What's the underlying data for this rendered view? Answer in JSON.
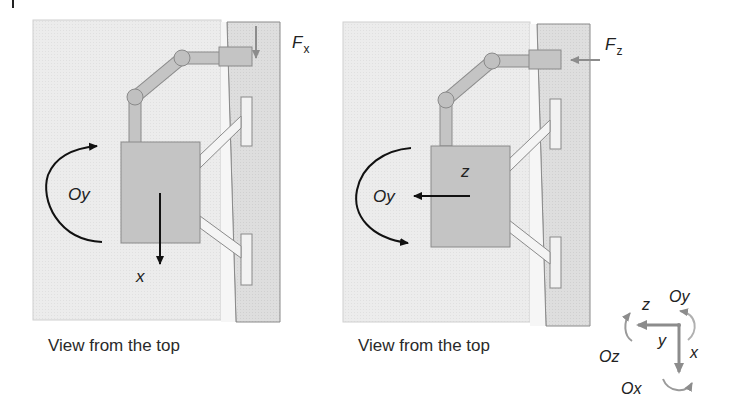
{
  "figure": {
    "panels": [
      {
        "id": "left",
        "caption": "View from the top",
        "force_label": "F",
        "force_subscript": "x",
        "rotation_label": "Oy",
        "axis_label": "x",
        "force_direction": "down",
        "rotation_direction": "counter-clockwise-top-arrow"
      },
      {
        "id": "right",
        "caption": "View from the top",
        "force_label": "F",
        "force_subscript": "z",
        "rotation_label": "Oy",
        "axis_label": "z",
        "force_direction": "left",
        "rotation_direction": "bottom-arrow"
      }
    ],
    "coordinate_frame": {
      "axes": [
        "z",
        "y",
        "x"
      ],
      "rotations": [
        "Oy",
        "Oz",
        "Ox"
      ],
      "z_label": "z",
      "y_label": "y",
      "x_label": "x",
      "oy_label": "Oy",
      "oz_label": "Oz",
      "ox_label": "Ox"
    },
    "colors": {
      "surface": "#ececec",
      "wall": "#dcdcdc",
      "robot": "#c4c4c4",
      "outline": "#8a8a8a",
      "arrow_dark": "#111111",
      "arrow_gray": "#8c8c8c"
    }
  }
}
